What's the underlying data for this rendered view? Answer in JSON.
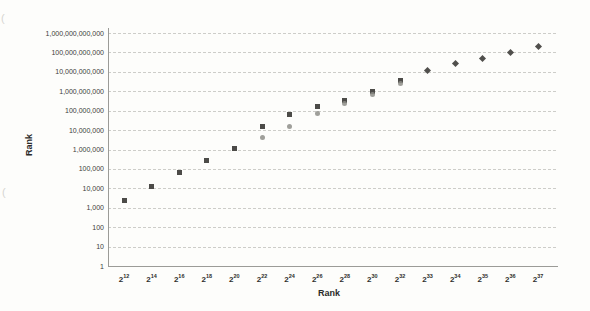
{
  "chart_data": {
    "type": "scatter",
    "title": "",
    "grid": "horizontal-dashed",
    "legend": "none",
    "x_axis": {
      "label": "Rank",
      "type": "category",
      "category_base": 2,
      "category_exponents": [
        12,
        14,
        16,
        18,
        20,
        22,
        24,
        26,
        28,
        30,
        32,
        33,
        34,
        35,
        36,
        37
      ]
    },
    "y_axis": {
      "label": "Rank",
      "scale": "log10",
      "min": 1,
      "max": 1000000000000,
      "tick_labels": [
        "1",
        "10",
        "100",
        "1,000",
        "10,000",
        "100,000",
        "1,000,000",
        "10,000,000",
        "100,000,000",
        "1,000,000,000",
        "10,000,000,000",
        "100,000,000,000",
        "1,000,000,000,000"
      ]
    },
    "series": [
      {
        "name": "dark-squares",
        "marker": "square",
        "color": "#4c4b48",
        "points": [
          [
            12,
            2500
          ],
          [
            14,
            13000
          ],
          [
            16,
            65000
          ],
          [
            18,
            260000
          ],
          [
            20,
            1100000
          ],
          [
            22,
            15000000
          ],
          [
            24,
            65000000
          ],
          [
            26,
            160000000
          ],
          [
            28,
            350000000
          ],
          [
            30,
            1000000000
          ],
          [
            32,
            3600000000
          ]
        ]
      },
      {
        "name": "gray-circles",
        "marker": "circle",
        "color": "#8e8e88",
        "points": [
          [
            22,
            4200000
          ],
          [
            24,
            16000000
          ],
          [
            26,
            70000000
          ],
          [
            28,
            230000000
          ],
          [
            30,
            700000000
          ],
          [
            32,
            2500000000
          ]
        ]
      },
      {
        "name": "dark-diamonds",
        "marker": "diamond",
        "color": "#504f4c",
        "points": [
          [
            33,
            12000000000
          ],
          [
            34,
            28000000000
          ],
          [
            35,
            50000000000
          ],
          [
            36,
            100000000000
          ],
          [
            37,
            200000000000
          ]
        ]
      }
    ]
  },
  "scan_artifacts": {
    "mark1": "(",
    "mark2": "("
  }
}
